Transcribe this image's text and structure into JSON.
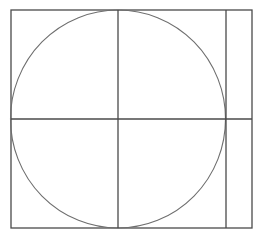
{
  "diagram": {
    "width": 263,
    "height": 238,
    "stroke_color": "#4a4a4a",
    "circle_color": "#6e6e6e",
    "background": "#ffffff",
    "outer_rect": {
      "x": 11,
      "y": 10,
      "w": 241,
      "h": 218
    },
    "circle": {
      "cx": 118,
      "cy": 119,
      "rx": 107.5,
      "ry": 109
    },
    "vertical_lines": [
      118,
      226
    ],
    "horizontal_lines": [
      119
    ]
  }
}
